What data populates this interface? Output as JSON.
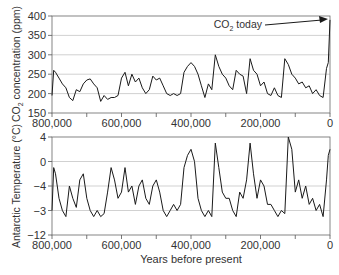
{
  "chart_data": [
    {
      "type": "line",
      "title": "",
      "ylabel": "CO2 concentration (ppm)",
      "xlabel": "",
      "yticks": [
        "400",
        "350",
        "300",
        "250",
        "200",
        "150"
      ],
      "ylim": [
        150,
        400
      ],
      "xticks": [
        "800,000",
        "600,000",
        "400,000",
        "200,000",
        "0"
      ],
      "xlim": [
        800000,
        0
      ],
      "grid": true,
      "annotation": "CO2 today",
      "x": [
        800000,
        795000,
        790000,
        780000,
        770000,
        760000,
        750000,
        740000,
        730000,
        720000,
        710000,
        700000,
        690000,
        680000,
        670000,
        660000,
        650000,
        640000,
        630000,
        620000,
        610000,
        600000,
        590000,
        580000,
        570000,
        560000,
        550000,
        540000,
        530000,
        520000,
        510000,
        500000,
        490000,
        480000,
        470000,
        460000,
        450000,
        440000,
        430000,
        420000,
        410000,
        400000,
        390000,
        380000,
        370000,
        360000,
        350000,
        340000,
        330000,
        320000,
        310000,
        300000,
        290000,
        280000,
        270000,
        260000,
        250000,
        240000,
        230000,
        220000,
        210000,
        200000,
        190000,
        180000,
        170000,
        160000,
        150000,
        140000,
        130000,
        120000,
        110000,
        100000,
        90000,
        80000,
        70000,
        60000,
        50000,
        40000,
        30000,
        20000,
        10000,
        5000,
        0
      ],
      "values": [
        195,
        260,
        255,
        240,
        225,
        215,
        190,
        182,
        210,
        205,
        225,
        235,
        238,
        225,
        215,
        180,
        195,
        185,
        190,
        190,
        195,
        240,
        255,
        220,
        250,
        230,
        240,
        215,
        200,
        210,
        245,
        235,
        240,
        220,
        200,
        195,
        200,
        195,
        200,
        255,
        270,
        280,
        270,
        250,
        220,
        190,
        225,
        210,
        300,
        270,
        250,
        240,
        220,
        210,
        260,
        250,
        245,
        200,
        290,
        260,
        250,
        220,
        230,
        200,
        195,
        215,
        195,
        190,
        290,
        275,
        250,
        240,
        225,
        230,
        215,
        220,
        200,
        210,
        195,
        190,
        265,
        280,
        390
      ]
    },
    {
      "type": "line",
      "title": "",
      "ylabel": "Antarctic Temperature (°C)",
      "xlabel": "Years before present",
      "yticks": [
        "4",
        "0",
        "-4",
        "-3",
        "-12"
      ],
      "ylim": [
        -12,
        4
      ],
      "xticks": [
        "800,000",
        "600,000",
        "400,000",
        "200,000",
        "0"
      ],
      "xlim": [
        800000,
        0
      ],
      "grid": true,
      "x": [
        800000,
        795000,
        790000,
        780000,
        770000,
        760000,
        750000,
        740000,
        730000,
        720000,
        710000,
        700000,
        690000,
        680000,
        670000,
        660000,
        650000,
        640000,
        630000,
        620000,
        610000,
        600000,
        590000,
        580000,
        570000,
        560000,
        550000,
        540000,
        530000,
        520000,
        510000,
        500000,
        490000,
        480000,
        470000,
        460000,
        450000,
        440000,
        430000,
        420000,
        410000,
        400000,
        390000,
        380000,
        370000,
        360000,
        350000,
        340000,
        330000,
        320000,
        310000,
        300000,
        290000,
        280000,
        270000,
        260000,
        250000,
        240000,
        230000,
        220000,
        210000,
        200000,
        190000,
        180000,
        170000,
        160000,
        150000,
        140000,
        130000,
        120000,
        110000,
        100000,
        90000,
        80000,
        70000,
        60000,
        50000,
        40000,
        30000,
        20000,
        10000,
        5000,
        0
      ],
      "values": [
        -8,
        -1,
        -2,
        -6,
        -8,
        -9,
        -4,
        -6,
        -7.5,
        -3,
        -2,
        -6,
        -8,
        -9,
        -8,
        -9,
        -8.5,
        -5,
        -1,
        -3,
        -6,
        -5,
        -1,
        -5,
        -4,
        -7,
        -4,
        -3,
        -6,
        -7,
        -4,
        -3,
        -5,
        -8,
        -9,
        -8,
        -7,
        -8,
        -7,
        -1,
        1,
        2,
        0,
        -6,
        -8,
        -9,
        -8,
        -9,
        3,
        -1,
        -5,
        -6,
        -6,
        -8,
        -9,
        -5,
        -6,
        -3,
        3,
        -2,
        -6,
        -3,
        -4,
        -7,
        -7,
        -8,
        -9,
        -8,
        -8.5,
        4,
        2,
        -5,
        -3,
        -6,
        -4,
        -7,
        -6,
        -8,
        -7,
        -9,
        -3,
        1,
        2
      ]
    }
  ],
  "top_panel": {
    "ylabel_main": "CO",
    "ylabel_sub": "2",
    "ylabel_rest": " concentration (ppm)",
    "yticks": [
      "400",
      "350",
      "300",
      "250",
      "200",
      "150"
    ],
    "xticks": [
      "800,000",
      "600,000",
      "400,000",
      "200,000",
      "0"
    ],
    "annotation_main": "CO",
    "annotation_sub": "2",
    "annotation_rest": " today"
  },
  "bottom_panel": {
    "ylabel": "Antarctic Temperature (°C)",
    "yticks": [
      "4",
      "0",
      "-4",
      "-3",
      "-12"
    ],
    "xticks": [
      "800,000",
      "600,000",
      "400,000",
      "200,000",
      "0"
    ],
    "xlabel": "Years before present"
  },
  "colors": {
    "line": "#1a1a1a",
    "grid": "#bdbdbd",
    "axis": "#555555"
  }
}
